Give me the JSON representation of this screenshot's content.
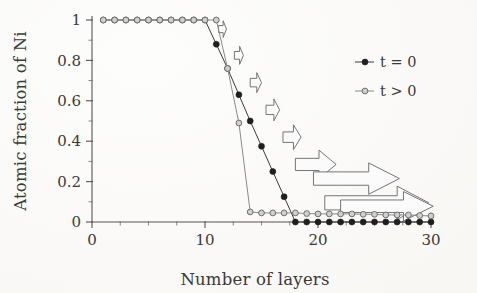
{
  "chart_data": {
    "type": "line",
    "title": "",
    "xlabel": "Number of layers",
    "ylabel": "Atomic fraction of Ni",
    "xlim": [
      0,
      30
    ],
    "ylim": [
      0,
      1
    ],
    "x_ticks": [
      0,
      10,
      20,
      30
    ],
    "x_tick_labels": [
      "0",
      "10",
      "20",
      "30"
    ],
    "x_minor_step": 2.5,
    "y_ticks": [
      0,
      0.2,
      0.4,
      0.6,
      0.8,
      1
    ],
    "y_tick_labels": [
      "0",
      "0.2",
      "0.4",
      "0.6",
      "0.8",
      "1"
    ],
    "y_minor_step": 0.1,
    "grid": false,
    "legend_position": "top-right",
    "series": [
      {
        "name": "t = 0",
        "marker": "filled-circle",
        "color": "#1f1f1f",
        "x": [
          1,
          2,
          3,
          4,
          5,
          6,
          7,
          8,
          9,
          10,
          11,
          12,
          13,
          14,
          15,
          16,
          17,
          18,
          19,
          20,
          21,
          22,
          23,
          24,
          25,
          26,
          27,
          28,
          29,
          30
        ],
        "values": [
          1,
          1,
          1,
          1,
          1,
          1,
          1,
          1,
          1,
          1,
          0.88,
          0.76,
          0.63,
          0.5,
          0.375,
          0.25,
          0.125,
          0,
          0,
          0,
          0,
          0,
          0,
          0,
          0,
          0,
          0,
          0,
          0,
          0
        ]
      },
      {
        "name": "t > 0",
        "marker": "open-circle",
        "color": "#8a8a8a",
        "x": [
          1,
          2,
          3,
          4,
          5,
          6,
          7,
          8,
          9,
          10,
          11,
          12,
          13,
          14,
          15,
          16,
          17,
          18,
          19,
          20,
          21,
          22,
          23,
          24,
          25,
          26,
          27,
          28,
          29,
          30
        ],
        "values": [
          1,
          1,
          1,
          1,
          1,
          1,
          1,
          1,
          1,
          1,
          1,
          0.76,
          0.49,
          0.05,
          0.045,
          0.045,
          0.045,
          0.045,
          0.042,
          0.04,
          0.04,
          0.04,
          0.04,
          0.038,
          0.038,
          0.035,
          0.035,
          0.035,
          0.032,
          0.03
        ]
      }
    ],
    "annotations": [
      {
        "kind": "arrow",
        "direction": "right",
        "x_start": 11.2,
        "x_end": 11.9,
        "y": 0.955,
        "thickness": 0.035
      },
      {
        "kind": "arrow",
        "direction": "right",
        "x_start": 12.6,
        "x_end": 13.4,
        "y": 0.825,
        "thickness": 0.038
      },
      {
        "kind": "arrow",
        "direction": "right",
        "x_start": 14.0,
        "x_end": 15.0,
        "y": 0.69,
        "thickness": 0.042
      },
      {
        "kind": "arrow",
        "direction": "right",
        "x_start": 15.4,
        "x_end": 16.6,
        "y": 0.555,
        "thickness": 0.046
      },
      {
        "kind": "arrow",
        "direction": "right",
        "x_start": 16.9,
        "x_end": 18.5,
        "y": 0.42,
        "thickness": 0.052
      },
      {
        "kind": "arrow",
        "direction": "right",
        "x_start": 18.0,
        "x_end": 21.6,
        "y": 0.285,
        "thickness": 0.06
      },
      {
        "kind": "arrow",
        "direction": "right",
        "x_start": 19.6,
        "x_end": 27.2,
        "y": 0.215,
        "thickness": 0.066
      },
      {
        "kind": "arrow",
        "direction": "right",
        "x_start": 20.6,
        "x_end": 29.8,
        "y": 0.095,
        "thickness": 0.07
      },
      {
        "kind": "arrow",
        "direction": "right",
        "x_start": 22.0,
        "x_end": 30.2,
        "y": 0.078,
        "thickness": 0.062
      }
    ]
  },
  "legend": {
    "entries": [
      {
        "label": "t = 0",
        "marker": "filled-circle"
      },
      {
        "label": "t > 0",
        "marker": "open-circle"
      }
    ]
  }
}
